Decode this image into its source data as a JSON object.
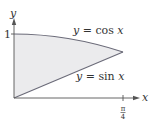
{
  "figure": {
    "type": "region-between-curves",
    "axes": {
      "x_label": "x",
      "y_label": "y",
      "y_tick_label": "1",
      "x_tick_label_num": "π",
      "x_tick_label_den": "4"
    },
    "curves": [
      {
        "name": "cos",
        "label_lhs": "y",
        "label_rest": " = cos ",
        "label_var": "x"
      },
      {
        "name": "sin",
        "label_lhs": "y",
        "label_rest": " = sin ",
        "label_var": "x"
      }
    ],
    "colors": {
      "axis": "#555555",
      "curve": "#6a6a78",
      "fill": "#ebebed",
      "text": "#333333"
    },
    "domain": [
      "0",
      "π/4"
    ]
  }
}
